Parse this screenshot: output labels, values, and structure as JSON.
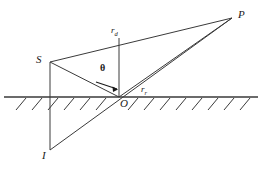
{
  "figure": {
    "kind": "ray-diagram",
    "background_color": "#ffffff",
    "line_color": "#3a3a3a",
    "ground_color": "#6b6b6b",
    "text_color": "#1a1a1a"
  },
  "labels": {
    "source": "S",
    "image": "I",
    "receiver": "P",
    "origin": "O",
    "direct_ray": "r",
    "direct_ray_sub": "d",
    "reflected_ray": "r",
    "reflected_ray_sub": "r",
    "angle": "θ"
  },
  "geometry": {
    "source_point": [
      50,
      62
    ],
    "image_point": [
      50,
      150
    ],
    "receiver_point": [
      232,
      18
    ],
    "origin_point": [
      119,
      97
    ],
    "apex_point": [
      119,
      38
    ],
    "ground_y": 97,
    "ground_x_start": 4,
    "ground_x_end": 258
  }
}
